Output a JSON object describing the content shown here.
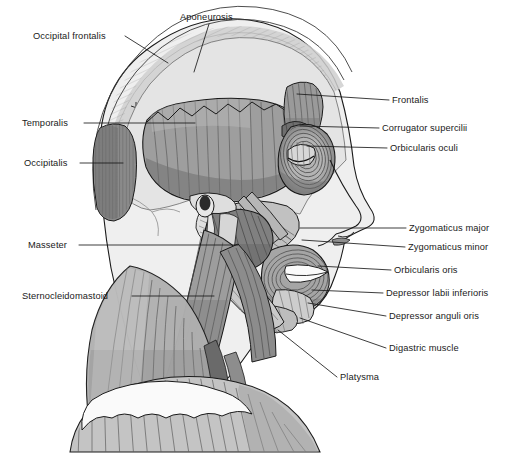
{
  "figure": {
    "view": "left lateral profile, facing right",
    "style": "grayscale line-and-tone anatomical illustration",
    "width": 510,
    "height": 466,
    "background_color": "#ffffff",
    "line_color": "#1a1a1a",
    "label_font_size_px": 9.3
  },
  "palette": {
    "background": "#ffffff",
    "skin": "#efefef",
    "skin_shadow": "#dcdcdc",
    "bone_light": "#e4e4e4",
    "bone_mid": "#d2d2d2",
    "aponeurosis": "#cfcfcf",
    "muscle_light": "#bdbdbd",
    "muscle_mid": "#9e9e9e",
    "muscle_dark": "#7d7d7d",
    "muscle_darkest": "#626262",
    "striation": "#6f6f6f",
    "outline": "#1a1a1a",
    "eye_pupil": "#2b2b2b",
    "highlight_white": "#fafafa"
  },
  "labels": {
    "left": [
      {
        "id": "occipital-frontalis",
        "text": "Occipital frontalis",
        "x": 33,
        "y": 31,
        "anchor_x": 122,
        "anchor_y": 36,
        "leader": [
          [
            125,
            36
          ],
          [
            168,
            63
          ]
        ]
      },
      {
        "id": "temporalis",
        "text": "Temporalis",
        "x": 22,
        "y": 118,
        "anchor_x": 81,
        "anchor_y": 123,
        "leader": [
          [
            84,
            123
          ],
          [
            195,
            123
          ]
        ]
      },
      {
        "id": "occipitalis",
        "text": "Occipitalis",
        "x": 24,
        "y": 158,
        "anchor_x": 77,
        "anchor_y": 163,
        "leader": [
          [
            80,
            163
          ],
          [
            123,
            163
          ]
        ]
      },
      {
        "id": "masseter",
        "text": "Masseter",
        "x": 28,
        "y": 240,
        "anchor_x": 76,
        "anchor_y": 245,
        "leader": [
          [
            79,
            245
          ],
          [
            238,
            245
          ]
        ]
      },
      {
        "id": "sternocleidomastoid",
        "text": "Sternocleidomastoid",
        "x": 22,
        "y": 291,
        "anchor_x": 129,
        "anchor_y": 296,
        "leader": [
          [
            132,
            296
          ],
          [
            214,
            296
          ]
        ]
      }
    ],
    "top": [
      {
        "id": "aponeurosis",
        "text": "Aponeurosis",
        "x": 180,
        "y": 12,
        "anchor_x": 212,
        "anchor_y": 22,
        "leader": [
          [
            209,
            24
          ],
          [
            194,
            72
          ]
        ]
      }
    ],
    "right": [
      {
        "id": "frontalis",
        "text": "Frontalis",
        "x": 392,
        "y": 95,
        "leader": [
          [
            389,
            100
          ],
          [
            297,
            94
          ]
        ]
      },
      {
        "id": "corrugator-supercilii",
        "text": "Corrugator supercilii",
        "x": 382,
        "y": 123,
        "leader": [
          [
            379,
            128
          ],
          [
            300,
            126
          ]
        ]
      },
      {
        "id": "orbiculares-oculi",
        "text": "Orbicularis oculi",
        "x": 390,
        "y": 143,
        "leader": [
          [
            387,
            148
          ],
          [
            307,
            146
          ]
        ]
      },
      {
        "id": "zygomaticus-major",
        "text": "Zygomaticus major",
        "x": 409,
        "y": 223,
        "leader": [
          [
            406,
            228
          ],
          [
            300,
            228
          ]
        ]
      },
      {
        "id": "zygomaticus-minor",
        "text": "Zygomaticus minor",
        "x": 408,
        "y": 242,
        "leader": [
          [
            405,
            247
          ],
          [
            302,
            240
          ]
        ]
      },
      {
        "id": "orbicularis-oris",
        "text": "Orbicularis oris",
        "x": 394,
        "y": 265,
        "leader": [
          [
            391,
            270
          ],
          [
            318,
            266
          ]
        ]
      },
      {
        "id": "depressor-labii-inferioris",
        "text": "Depressor labii inferioris",
        "x": 386,
        "y": 288,
        "leader": [
          [
            383,
            293
          ],
          [
            312,
            290
          ]
        ]
      },
      {
        "id": "depressor-anguli-oris",
        "text": "Depressor anguli oris",
        "x": 389,
        "y": 311,
        "leader": [
          [
            386,
            316
          ],
          [
            308,
            303
          ]
        ]
      },
      {
        "id": "digastric-muscle",
        "text": "Digastric muscle",
        "x": 389,
        "y": 343,
        "leader": [
          [
            386,
            348
          ],
          [
            300,
            318
          ]
        ]
      },
      {
        "id": "platysma",
        "text": "Platysma",
        "x": 340,
        "y": 372,
        "leader": [
          [
            337,
            377
          ],
          [
            278,
            330
          ]
        ]
      }
    ]
  },
  "structures": [
    {
      "id": "cranium",
      "name": "Cranium / skull vault",
      "tone": "bone_light"
    },
    {
      "id": "galea-aponeurotica",
      "name": "Galea aponeurotica (aponeurosis)",
      "tone": "aponeurosis"
    },
    {
      "id": "occipital-frontalis",
      "name": "Occipitofrontalis",
      "tone": "muscle_mid"
    },
    {
      "id": "temporalis",
      "name": "Temporalis",
      "tone": "muscle_mid"
    },
    {
      "id": "occipitalis",
      "name": "Occipitalis",
      "tone": "muscle_dark"
    },
    {
      "id": "frontalis",
      "name": "Frontalis",
      "tone": "muscle_mid"
    },
    {
      "id": "corrugator",
      "name": "Corrugator supercilii",
      "tone": "muscle_dark"
    },
    {
      "id": "orbicularis-oculi",
      "name": "Orbicularis oculi",
      "tone": "muscle_mid"
    },
    {
      "id": "zygomaticus",
      "name": "Zygomaticus major and minor",
      "tone": "muscle_light"
    },
    {
      "id": "orbicularis-oris",
      "name": "Orbicularis oris",
      "tone": "muscle_mid"
    },
    {
      "id": "masseter",
      "name": "Masseter",
      "tone": "muscle_dark"
    },
    {
      "id": "depressor-labii",
      "name": "Depressor labii inferioris",
      "tone": "muscle_light"
    },
    {
      "id": "depressor-anguli",
      "name": "Depressor anguli oris",
      "tone": "muscle_light"
    },
    {
      "id": "digastric",
      "name": "Digastric muscle",
      "tone": "muscle_light"
    },
    {
      "id": "sternocleidomastoid",
      "name": "Sternocleidomastoid",
      "tone": "muscle_mid"
    },
    {
      "id": "platysma",
      "name": "Platysma",
      "tone": "muscle_light"
    },
    {
      "id": "trapezius-shoulder",
      "name": "Shoulder / trapezius region",
      "tone": "muscle_light"
    }
  ]
}
